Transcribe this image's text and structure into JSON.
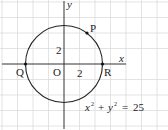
{
  "diagram": {
    "type": "coordinate-plane-circle",
    "axes": {
      "x_label": "x",
      "y_label": "y",
      "origin_label": "O"
    },
    "ticks": {
      "x_tick_label": "2",
      "y_tick_label": "2"
    },
    "circle": {
      "equation_lhs_x": "x",
      "equation_lhs_y": "y",
      "exponent": "2",
      "plus": "+",
      "equals": "=",
      "rhs": "25",
      "radius": 5
    },
    "points": [
      {
        "name": "P",
        "label": "P"
      },
      {
        "name": "Q",
        "label": "Q"
      },
      {
        "name": "R",
        "label": "R"
      }
    ],
    "grid_spacing_units": 2,
    "colors": {
      "curve": "#222222",
      "axis": "#333333",
      "grid": "#d8d8d8"
    }
  }
}
